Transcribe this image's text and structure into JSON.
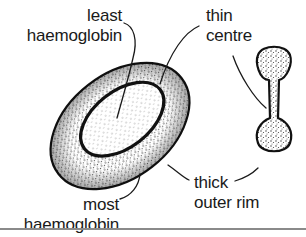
{
  "figure": {
    "views": [
      "surface view (oblique)",
      "cross-section view"
    ],
    "labels": {
      "least": [
        "least",
        "haemoglobin"
      ],
      "thin": [
        "thin",
        "centre"
      ],
      "most": [
        "most",
        "haemoglobin"
      ],
      "thick": [
        "thick",
        "outer rim"
      ]
    }
  },
  "colors": {
    "ink": "#1a1a1a",
    "stipple": "#555555",
    "background": "#ffffff",
    "rule": "#8a8a8a"
  }
}
